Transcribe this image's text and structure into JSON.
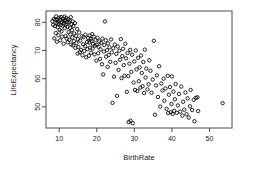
{
  "chart_data": {
    "type": "scatter",
    "title": "",
    "xlabel": "BirthRate",
    "ylabel": "LifeExpectancy",
    "xlim": [
      6.5,
      56
    ],
    "ylim": [
      42.5,
      84
    ],
    "xticks": [
      10,
      20,
      30,
      40,
      50
    ],
    "yticks": [
      50,
      60,
      70,
      80
    ],
    "grid": false,
    "legend": null,
    "marker": "open-circle",
    "marker_color": "#000000",
    "points": [
      [
        8.2,
        80.4
      ],
      [
        8.4,
        79.1
      ],
      [
        8.6,
        81.2
      ],
      [
        8.7,
        74.3
      ],
      [
        8.9,
        78.6
      ],
      [
        9.0,
        80.9
      ],
      [
        9.1,
        76.2
      ],
      [
        9.2,
        82.1
      ],
      [
        9.3,
        79.8
      ],
      [
        9.4,
        73.1
      ],
      [
        9.5,
        81.0
      ],
      [
        9.6,
        78.2
      ],
      [
        9.7,
        80.2
      ],
      [
        9.8,
        75.4
      ],
      [
        9.9,
        79.4
      ],
      [
        10.0,
        81.6
      ],
      [
        10.1,
        77.3
      ],
      [
        10.2,
        80.8
      ],
      [
        10.3,
        73.6
      ],
      [
        10.4,
        79.0
      ],
      [
        10.5,
        81.9
      ],
      [
        10.6,
        76.8
      ],
      [
        10.7,
        80.1
      ],
      [
        10.8,
        74.9
      ],
      [
        10.9,
        78.8
      ],
      [
        11.0,
        81.3
      ],
      [
        11.1,
        80.5
      ],
      [
        11.2,
        72.4
      ],
      [
        11.3,
        79.6
      ],
      [
        11.4,
        82.0
      ],
      [
        11.5,
        77.9
      ],
      [
        11.6,
        80.7
      ],
      [
        11.7,
        75.1
      ],
      [
        11.8,
        79.2
      ],
      [
        11.9,
        81.5
      ],
      [
        12.0,
        74.2
      ],
      [
        12.1,
        80.0
      ],
      [
        12.2,
        78.4
      ],
      [
        12.3,
        72.9
      ],
      [
        12.4,
        81.1
      ],
      [
        12.5,
        76.5
      ],
      [
        12.6,
        79.9
      ],
      [
        12.7,
        73.8
      ],
      [
        12.8,
        80.6
      ],
      [
        12.9,
        78.0
      ],
      [
        13.0,
        75.7
      ],
      [
        13.1,
        81.8
      ],
      [
        13.2,
        72.1
      ],
      [
        13.3,
        79.3
      ],
      [
        13.4,
        77.2
      ],
      [
        13.5,
        74.6
      ],
      [
        13.6,
        80.3
      ],
      [
        13.7,
        71.8
      ],
      [
        13.8,
        78.7
      ],
      [
        13.9,
        73.3
      ],
      [
        14.0,
        76.0
      ],
      [
        14.2,
        79.7
      ],
      [
        14.3,
        70.9
      ],
      [
        14.5,
        75.2
      ],
      [
        14.6,
        72.6
      ],
      [
        14.8,
        77.6
      ],
      [
        14.9,
        68.9
      ],
      [
        15.0,
        74.0
      ],
      [
        15.1,
        71.2
      ],
      [
        15.3,
        76.4
      ],
      [
        15.5,
        69.4
      ],
      [
        15.6,
        73.5
      ],
      [
        15.8,
        70.2
      ],
      [
        16.0,
        75.0
      ],
      [
        16.2,
        68.3
      ],
      [
        16.4,
        72.2
      ],
      [
        16.5,
        74.7
      ],
      [
        16.7,
        69.8
      ],
      [
        16.9,
        71.5
      ],
      [
        17.0,
        75.6
      ],
      [
        17.2,
        67.6
      ],
      [
        17.4,
        73.0
      ],
      [
        17.5,
        70.5
      ],
      [
        17.7,
        74.4
      ],
      [
        17.9,
        68.1
      ],
      [
        18.0,
        72.8
      ],
      [
        18.1,
        75.3
      ],
      [
        18.2,
        71.0
      ],
      [
        18.4,
        74.1
      ],
      [
        18.5,
        69.2
      ],
      [
        18.6,
        73.4
      ],
      [
        18.8,
        75.8
      ],
      [
        18.9,
        70.7
      ],
      [
        19.0,
        72.3
      ],
      [
        19.2,
        74.9
      ],
      [
        19.4,
        68.6
      ],
      [
        19.5,
        71.7
      ],
      [
        19.7,
        73.7
      ],
      [
        19.9,
        66.4
      ],
      [
        20.0,
        72.0
      ],
      [
        20.2,
        74.5
      ],
      [
        20.4,
        69.0
      ],
      [
        20.5,
        71.3
      ],
      [
        20.7,
        73.2
      ],
      [
        20.9,
        67.0
      ],
      [
        21.0,
        70.4
      ],
      [
        21.2,
        72.7
      ],
      [
        21.4,
        65.1
      ],
      [
        21.5,
        74.2
      ],
      [
        21.7,
        61.5
      ],
      [
        21.9,
        69.6
      ],
      [
        22.0,
        71.9
      ],
      [
        22.2,
        80.3
      ],
      [
        22.4,
        73.6
      ],
      [
        22.5,
        67.8
      ],
      [
        22.7,
        70.1
      ],
      [
        22.9,
        64.2
      ],
      [
        23.0,
        72.5
      ],
      [
        23.2,
        68.4
      ],
      [
        23.4,
        71.1
      ],
      [
        23.6,
        66.0
      ],
      [
        23.8,
        73.9
      ],
      [
        24.0,
        69.3
      ],
      [
        24.2,
        51.4
      ],
      [
        24.4,
        70.8
      ],
      [
        24.6,
        60.7
      ],
      [
        24.8,
        72.1
      ],
      [
        25.0,
        65.6
      ],
      [
        25.2,
        68.8
      ],
      [
        25.4,
        53.9
      ],
      [
        25.6,
        71.4
      ],
      [
        25.8,
        63.1
      ],
      [
        26.0,
        69.9
      ],
      [
        26.2,
        66.7
      ],
      [
        26.4,
        74.0
      ],
      [
        26.6,
        60.2
      ],
      [
        26.8,
        68.0
      ],
      [
        27.0,
        70.6
      ],
      [
        27.2,
        64.8
      ],
      [
        27.4,
        61.0
      ],
      [
        27.6,
        72.4
      ],
      [
        27.8,
        67.2
      ],
      [
        28.0,
        55.3
      ],
      [
        28.2,
        69.1
      ],
      [
        28.4,
        60.9
      ],
      [
        28.5,
        44.6
      ],
      [
        28.7,
        65.3
      ],
      [
        28.9,
        70.2
      ],
      [
        29.0,
        45.1
      ],
      [
        29.2,
        62.4
      ],
      [
        29.4,
        68.5
      ],
      [
        29.6,
        44.2
      ],
      [
        29.8,
        58.6
      ],
      [
        30.0,
        66.1
      ],
      [
        30.2,
        56.0
      ],
      [
        30.4,
        70.0
      ],
      [
        30.6,
        63.3
      ],
      [
        30.8,
        55.6
      ],
      [
        31.0,
        67.4
      ],
      [
        31.2,
        59.1
      ],
      [
        31.4,
        64.0
      ],
      [
        31.6,
        56.8
      ],
      [
        31.8,
        68.2
      ],
      [
        32.0,
        62.0
      ],
      [
        32.2,
        57.3
      ],
      [
        32.4,
        65.9
      ],
      [
        32.6,
        54.9
      ],
      [
        32.8,
        70.3
      ],
      [
        33.0,
        60.4
      ],
      [
        33.2,
        63.6
      ],
      [
        33.5,
        56.2
      ],
      [
        33.8,
        58.0
      ],
      [
        34.0,
        66.5
      ],
      [
        34.3,
        62.8
      ],
      [
        34.6,
        55.0
      ],
      [
        34.9,
        59.7
      ],
      [
        35.2,
        73.4
      ],
      [
        35.5,
        47.2
      ],
      [
        35.8,
        57.6
      ],
      [
        36.0,
        61.2
      ],
      [
        36.3,
        53.5
      ],
      [
        36.6,
        64.4
      ],
      [
        36.9,
        50.1
      ],
      [
        37.2,
        58.3
      ],
      [
        37.5,
        55.8
      ],
      [
        37.8,
        60.0
      ],
      [
        38.0,
        52.2
      ],
      [
        38.3,
        56.5
      ],
      [
        38.6,
        49.3
      ],
      [
        38.9,
        61.0
      ],
      [
        39.0,
        47.8
      ],
      [
        39.2,
        54.3
      ],
      [
        39.5,
        57.0
      ],
      [
        39.7,
        48.1
      ],
      [
        39.9,
        51.0
      ],
      [
        40.0,
        60.8
      ],
      [
        40.2,
        47.5
      ],
      [
        40.4,
        55.4
      ],
      [
        40.6,
        48.6
      ],
      [
        40.8,
        52.7
      ],
      [
        41.0,
        58.1
      ],
      [
        41.3,
        47.9
      ],
      [
        41.6,
        50.5
      ],
      [
        41.9,
        54.6
      ],
      [
        42.2,
        48.3
      ],
      [
        42.5,
        57.2
      ],
      [
        42.8,
        46.9
      ],
      [
        43.0,
        51.8
      ],
      [
        43.3,
        49.0
      ],
      [
        43.6,
        55.1
      ],
      [
        43.9,
        47.4
      ],
      [
        44.2,
        53.0
      ],
      [
        44.5,
        46.2
      ],
      [
        44.8,
        50.2
      ],
      [
        45.0,
        56.0
      ],
      [
        45.4,
        48.9
      ],
      [
        45.8,
        52.5
      ],
      [
        46.0,
        44.9
      ],
      [
        46.4,
        53.2
      ],
      [
        46.8,
        53.4
      ],
      [
        47.0,
        48.5
      ],
      [
        53.5,
        51.3
      ]
    ]
  }
}
